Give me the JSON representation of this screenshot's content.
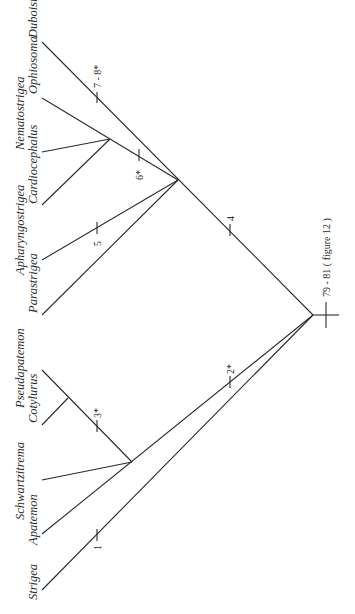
{
  "figure": {
    "type": "cladogram",
    "orientation": "rotated 90 degrees counter-clockwise; taxa labels read bottom-to-top along left edge"
  },
  "taxa": [
    {
      "name": "Strigea",
      "row": 0
    },
    {
      "name": "Apatemon",
      "row": 1
    },
    {
      "name": "Schwartzitrema",
      "row": 0
    },
    {
      "name": "Cotylurus",
      "row": 1
    },
    {
      "name": "Pseudapatemon",
      "row": 0
    },
    {
      "name": "Parastrigea",
      "row": 1
    },
    {
      "name": "Apharyngostrigea",
      "row": 0
    },
    {
      "name": "Cardiocephalus",
      "row": 1
    },
    {
      "name": "Nematostrigea",
      "row": 0
    },
    {
      "name": "Ophiosoma",
      "row": 1
    },
    {
      "name": "Duboisiella",
      "row": 1
    }
  ],
  "characters": {
    "root": "79 - 81 ( figure 12 )",
    "c1": "1",
    "c2": "2",
    "c2_star": "*",
    "c3": "3",
    "c3_star": "*",
    "c4": "4",
    "c5": "5",
    "c6": "6",
    "c6_star": "*",
    "c78": "7 - 8",
    "c78_star": "*"
  },
  "topology": "(Strigea,(Apatemon,(Schwartzitrema,(Cotylurus,Pseudapatemon))2*),((Parastrigea,Apharyngostrigea5,(Cardiocephalus,Nematostrigea,Ophiosoma)6*),Duboisiella7-8*)4)"
}
